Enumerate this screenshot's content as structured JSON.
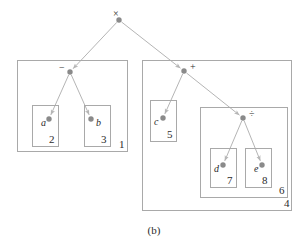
{
  "figure": {
    "caption": "(b)",
    "caption_x": 0,
    "caption_y": 224,
    "width": 308,
    "height": 244,
    "background": "#ffffff",
    "edge_color": "#b5b5b5",
    "node_color": "#8a8a8a",
    "box_border_color": "#a9a9a9",
    "text_color": "#2b2b2b"
  },
  "tree": {
    "description": "Expression tree for (a - b) x (c + (d / e)) with nested scope boxes",
    "nodes": [
      {
        "id": "root",
        "label": "×",
        "kind": "operator",
        "x": 119,
        "y": 20,
        "label_x": 113,
        "label_y": 9
      },
      {
        "id": "minus",
        "label": "−",
        "kind": "operator",
        "x": 70,
        "y": 72,
        "label_x": 59,
        "label_y": 63
      },
      {
        "id": "plus",
        "label": "+",
        "kind": "operator",
        "x": 184,
        "y": 71,
        "label_x": 190,
        "label_y": 62
      },
      {
        "id": "divide",
        "label": "÷",
        "kind": "operator",
        "x": 243,
        "y": 118,
        "label_x": 249,
        "label_y": 109
      },
      {
        "id": "a",
        "label": "a",
        "kind": "variable",
        "x": 49,
        "y": 119,
        "label_x": 41,
        "label_y": 118
      },
      {
        "id": "b",
        "label": "b",
        "kind": "variable",
        "x": 91,
        "y": 119,
        "label_x": 96,
        "label_y": 118
      },
      {
        "id": "c",
        "label": "c",
        "kind": "variable",
        "x": 163,
        "y": 118,
        "label_x": 154,
        "label_y": 117
      },
      {
        "id": "d",
        "label": "d",
        "kind": "variable",
        "x": 223,
        "y": 165,
        "label_x": 214,
        "label_y": 164
      },
      {
        "id": "e",
        "label": "e",
        "kind": "variable",
        "x": 262,
        "y": 165,
        "label_x": 254,
        "label_y": 164
      }
    ],
    "edges": [
      {
        "from": "root",
        "to": "minus",
        "arrow": true
      },
      {
        "from": "root",
        "to": "plus",
        "arrow": true
      },
      {
        "from": "minus",
        "to": "a",
        "arrow": true
      },
      {
        "from": "minus",
        "to": "b",
        "arrow": true
      },
      {
        "from": "plus",
        "to": "c",
        "arrow": true
      },
      {
        "from": "plus",
        "to": "divide",
        "arrow": true
      },
      {
        "from": "divide",
        "to": "d",
        "arrow": true
      },
      {
        "from": "divide",
        "to": "e",
        "arrow": true
      }
    ]
  },
  "boxes": [
    {
      "id": "box1",
      "label": "1",
      "x": 17,
      "y": 60,
      "w": 111,
      "h": 92,
      "label_x": 119,
      "label_y": 139
    },
    {
      "id": "box2",
      "label": "2",
      "x": 32,
      "y": 105,
      "w": 27,
      "h": 42,
      "label_x": 49,
      "label_y": 134
    },
    {
      "id": "box3",
      "label": "3",
      "x": 84,
      "y": 105,
      "w": 27,
      "h": 42,
      "label_x": 101,
      "label_y": 134
    },
    {
      "id": "box4",
      "label": "4",
      "x": 142,
      "y": 60,
      "w": 150,
      "h": 151,
      "label_x": 284,
      "label_y": 198
    },
    {
      "id": "box5",
      "label": "5",
      "x": 150,
      "y": 100,
      "w": 27,
      "h": 42,
      "label_x": 167,
      "label_y": 129
    },
    {
      "id": "box6",
      "label": "6",
      "x": 200,
      "y": 107,
      "w": 88,
      "h": 91,
      "label_x": 279,
      "label_y": 185
    },
    {
      "id": "box7",
      "label": "7",
      "x": 210,
      "y": 148,
      "w": 27,
      "h": 40,
      "label_x": 227,
      "label_y": 175
    },
    {
      "id": "box8",
      "label": "8",
      "x": 245,
      "y": 148,
      "w": 27,
      "h": 40,
      "label_x": 262,
      "label_y": 175
    }
  ]
}
